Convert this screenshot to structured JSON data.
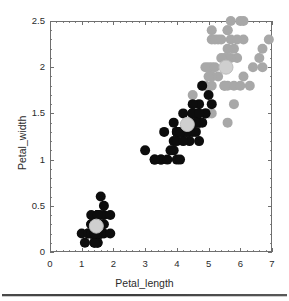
{
  "figure": {
    "title": "",
    "background": "#ffffff"
  },
  "axes": {
    "x": {
      "label": "Petal_length",
      "ticks": [
        "0",
        "1",
        "2",
        "3",
        "4",
        "5",
        "6",
        "7"
      ],
      "min": 0,
      "max": 7
    },
    "y": {
      "label": "Petal_width",
      "ticks": [
        "0",
        "0.5",
        "1",
        "1.5",
        "2",
        "2.5"
      ],
      "min": 0,
      "max": 2.5
    },
    "frame_color": "#6f6f6f",
    "grid": false
  },
  "colors": {
    "black_marker": "#0d0d0d",
    "gray_marker": "#a8a8a8",
    "centroid": "#cfcfcf",
    "centroid_stroke": "#bdbdbd",
    "axis": "#6f6f6f",
    "text": "#2b2b2b"
  },
  "chart_data": {
    "type": "scatter",
    "title": "",
    "xlabel": "Petal_length",
    "ylabel": "Petal_width",
    "xlim": [
      0,
      7
    ],
    "ylim": [
      0,
      2.5
    ],
    "grid": false,
    "legend": "none",
    "marker_radius_px": 5.0,
    "centroid_radius_px": 7.0,
    "series": [
      {
        "name": "black-points",
        "color": "#0d0d0d",
        "points": [
          [
            1.4,
            0.2
          ],
          [
            1.4,
            0.2
          ],
          [
            1.3,
            0.2
          ],
          [
            1.5,
            0.2
          ],
          [
            1.4,
            0.2
          ],
          [
            1.7,
            0.4
          ],
          [
            1.4,
            0.3
          ],
          [
            1.5,
            0.2
          ],
          [
            1.4,
            0.2
          ],
          [
            1.5,
            0.1
          ],
          [
            1.5,
            0.2
          ],
          [
            1.6,
            0.2
          ],
          [
            1.4,
            0.1
          ],
          [
            1.1,
            0.1
          ],
          [
            1.2,
            0.2
          ],
          [
            1.5,
            0.4
          ],
          [
            1.3,
            0.4
          ],
          [
            1.4,
            0.3
          ],
          [
            1.7,
            0.3
          ],
          [
            1.5,
            0.3
          ],
          [
            1.7,
            0.2
          ],
          [
            1.5,
            0.4
          ],
          [
            1.0,
            0.2
          ],
          [
            1.7,
            0.5
          ],
          [
            1.9,
            0.2
          ],
          [
            1.6,
            0.2
          ],
          [
            1.6,
            0.4
          ],
          [
            1.5,
            0.2
          ],
          [
            1.4,
            0.2
          ],
          [
            1.6,
            0.2
          ],
          [
            1.6,
            0.2
          ],
          [
            1.5,
            0.4
          ],
          [
            1.5,
            0.1
          ],
          [
            1.4,
            0.2
          ],
          [
            1.5,
            0.2
          ],
          [
            1.2,
            0.2
          ],
          [
            1.3,
            0.2
          ],
          [
            1.4,
            0.1
          ],
          [
            1.3,
            0.2
          ],
          [
            1.5,
            0.2
          ],
          [
            1.3,
            0.3
          ],
          [
            1.3,
            0.3
          ],
          [
            1.3,
            0.2
          ],
          [
            1.6,
            0.6
          ],
          [
            1.9,
            0.4
          ],
          [
            1.4,
            0.3
          ],
          [
            1.6,
            0.2
          ],
          [
            1.4,
            0.2
          ],
          [
            1.5,
            0.2
          ],
          [
            1.4,
            0.2
          ],
          [
            4.7,
            1.4
          ],
          [
            4.5,
            1.5
          ],
          [
            4.9,
            1.5
          ],
          [
            4.0,
            1.3
          ],
          [
            4.6,
            1.5
          ],
          [
            4.5,
            1.3
          ],
          [
            4.7,
            1.6
          ],
          [
            3.3,
            1.0
          ],
          [
            4.6,
            1.3
          ],
          [
            3.9,
            1.4
          ],
          [
            3.5,
            1.0
          ],
          [
            4.2,
            1.5
          ],
          [
            4.0,
            1.0
          ],
          [
            4.7,
            1.4
          ],
          [
            3.6,
            1.3
          ],
          [
            4.4,
            1.4
          ],
          [
            4.5,
            1.5
          ],
          [
            4.1,
            1.0
          ],
          [
            4.5,
            1.5
          ],
          [
            3.9,
            1.1
          ],
          [
            4.8,
            1.8
          ],
          [
            4.0,
            1.3
          ],
          [
            4.9,
            1.5
          ],
          [
            4.7,
            1.2
          ],
          [
            4.3,
            1.3
          ],
          [
            4.4,
            1.4
          ],
          [
            4.8,
            1.4
          ],
          [
            5.0,
            1.7
          ],
          [
            4.5,
            1.5
          ],
          [
            3.5,
            1.0
          ],
          [
            3.8,
            1.1
          ],
          [
            3.7,
            1.0
          ],
          [
            3.9,
            1.2
          ],
          [
            5.1,
            1.6
          ],
          [
            4.5,
            1.5
          ],
          [
            4.5,
            1.6
          ],
          [
            4.7,
            1.5
          ],
          [
            4.4,
            1.3
          ],
          [
            4.1,
            1.3
          ],
          [
            4.0,
            1.3
          ],
          [
            4.4,
            1.2
          ],
          [
            4.6,
            1.4
          ],
          [
            4.0,
            1.2
          ],
          [
            3.3,
            1.0
          ],
          [
            4.2,
            1.3
          ],
          [
            4.2,
            1.2
          ],
          [
            4.2,
            1.3
          ],
          [
            4.3,
            1.3
          ],
          [
            3.0,
            1.1
          ],
          [
            4.1,
            1.3
          ]
        ]
      },
      {
        "name": "gray-points",
        "color": "#a8a8a8",
        "points": [
          [
            6.0,
            2.5
          ],
          [
            5.1,
            1.9
          ],
          [
            5.9,
            2.1
          ],
          [
            5.6,
            1.8
          ],
          [
            5.8,
            2.2
          ],
          [
            6.6,
            2.1
          ],
          [
            4.5,
            1.7
          ],
          [
            6.3,
            1.8
          ],
          [
            5.8,
            1.8
          ],
          [
            6.1,
            2.5
          ],
          [
            5.1,
            2.0
          ],
          [
            5.3,
            1.9
          ],
          [
            5.5,
            2.1
          ],
          [
            5.0,
            2.0
          ],
          [
            5.1,
            2.4
          ],
          [
            5.3,
            2.3
          ],
          [
            5.5,
            1.8
          ],
          [
            6.7,
            2.2
          ],
          [
            6.9,
            2.3
          ],
          [
            5.0,
            1.5
          ],
          [
            5.7,
            2.3
          ],
          [
            4.9,
            2.0
          ],
          [
            6.7,
            2.0
          ],
          [
            4.9,
            1.8
          ],
          [
            5.7,
            2.1
          ],
          [
            6.0,
            1.8
          ],
          [
            4.8,
            1.8
          ],
          [
            4.9,
            1.8
          ],
          [
            5.6,
            2.1
          ],
          [
            5.8,
            1.6
          ],
          [
            6.1,
            1.9
          ],
          [
            6.4,
            2.0
          ],
          [
            5.6,
            2.2
          ],
          [
            5.1,
            1.5
          ],
          [
            5.6,
            1.4
          ],
          [
            6.1,
            2.3
          ],
          [
            5.6,
            2.4
          ],
          [
            5.5,
            1.8
          ],
          [
            4.8,
            1.8
          ],
          [
            5.4,
            2.1
          ],
          [
            5.6,
            2.4
          ],
          [
            5.1,
            2.3
          ],
          [
            5.1,
            1.9
          ],
          [
            5.9,
            2.3
          ],
          [
            5.7,
            2.5
          ],
          [
            5.2,
            2.3
          ],
          [
            5.0,
            1.9
          ],
          [
            5.2,
            2.0
          ],
          [
            5.4,
            2.3
          ],
          [
            5.1,
            1.8
          ]
        ]
      },
      {
        "name": "cluster-centroids",
        "color": "#cfcfcf",
        "points": [
          [
            1.46,
            0.28
          ],
          [
            4.33,
            1.38
          ],
          [
            5.55,
            2.0
          ]
        ]
      }
    ]
  }
}
